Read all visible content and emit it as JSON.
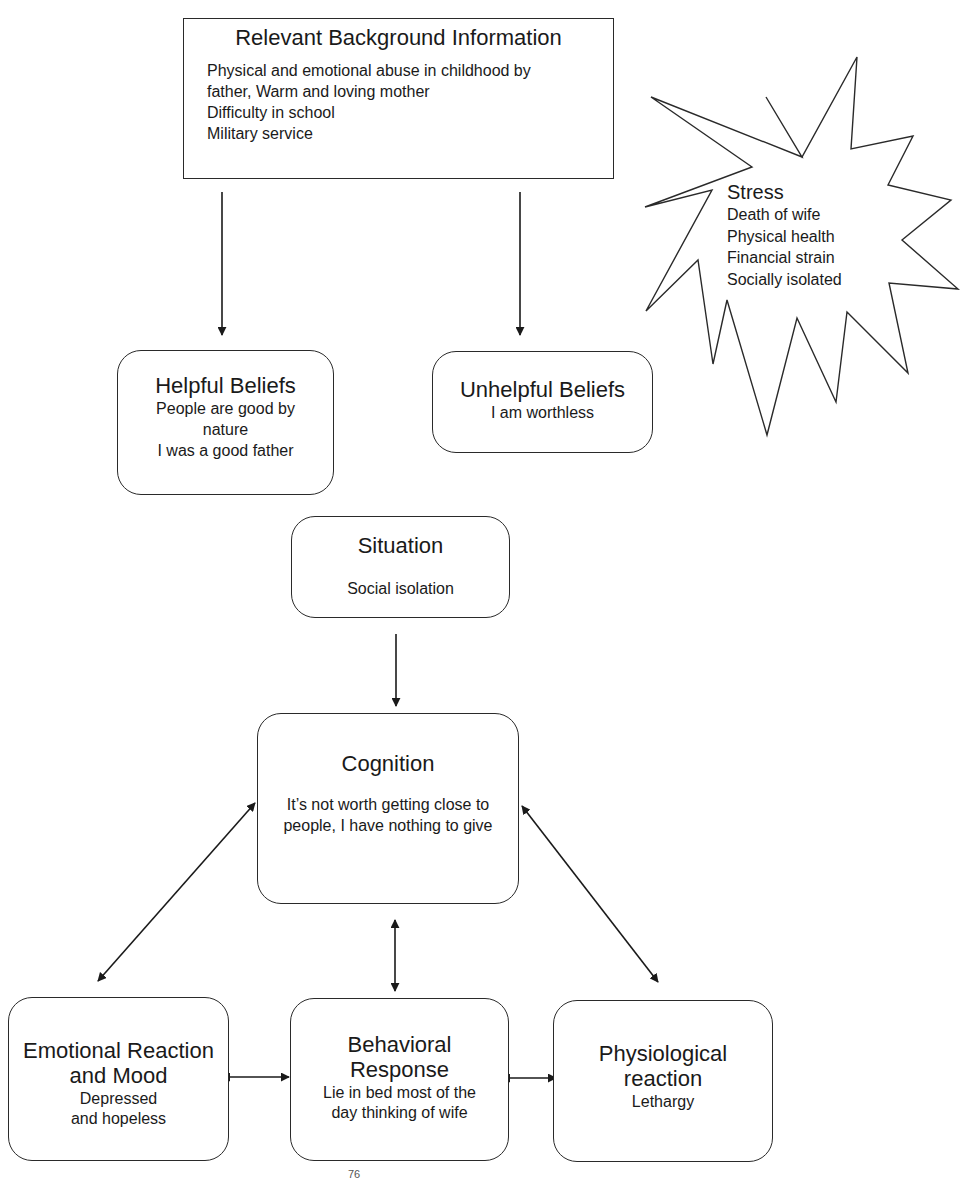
{
  "background": {
    "title": "Relevant Background Information",
    "lines": [
      "Physical and emotional abuse in childhood by",
      "father, Warm and loving mother",
      "Difficulty in school",
      "Military service"
    ]
  },
  "stress": {
    "title": "Stress",
    "lines": [
      "Death of wife",
      "Physical health",
      "Financial strain",
      "Socially isolated"
    ]
  },
  "helpful_beliefs": {
    "title": "Helpful Beliefs",
    "lines": [
      "People are good by",
      "nature",
      "I was a good father"
    ]
  },
  "unhelpful_beliefs": {
    "title": "Unhelpful Beliefs",
    "lines": [
      "I am worthless"
    ]
  },
  "situation": {
    "title": "Situation",
    "lines": [
      "Social isolation"
    ]
  },
  "cognition": {
    "title": "Cognition",
    "lines": [
      "It’s not worth getting close to",
      "people, I have nothing to give"
    ]
  },
  "emotional": {
    "title_lines": [
      "Emotional Reaction",
      "and Mood"
    ],
    "lines": [
      "Depressed",
      "and hopeless"
    ]
  },
  "behavioral": {
    "title_lines": [
      "Behavioral",
      "Response"
    ],
    "lines": [
      "Lie in bed most of the",
      "day thinking of wife"
    ]
  },
  "physiological": {
    "title_lines": [
      "Physiological",
      "reaction"
    ],
    "lines": [
      "Lethargy"
    ]
  },
  "caption": {
    "superscript": "76"
  },
  "colors": {
    "stroke": "#2a2a2a",
    "background": "#ffffff"
  }
}
